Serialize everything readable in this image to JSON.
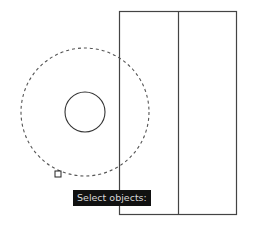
{
  "drawing": {
    "rectangle": {
      "x": 119,
      "y": 11,
      "width": 117,
      "height": 203,
      "stroke": "#444444"
    },
    "divider_line": {
      "x": 178,
      "y1": 11,
      "y2": 214,
      "stroke": "#444444"
    },
    "outer_circle": {
      "cx": 85,
      "cy": 112,
      "r": 64,
      "stroke": "#555555",
      "style": "dashed"
    },
    "inner_circle": {
      "cx": 85,
      "cy": 112,
      "r": 20,
      "stroke": "#333333"
    },
    "grip": {
      "x": 55,
      "y": 171,
      "size": 6
    }
  },
  "prompt": {
    "text": "Select objects:"
  }
}
